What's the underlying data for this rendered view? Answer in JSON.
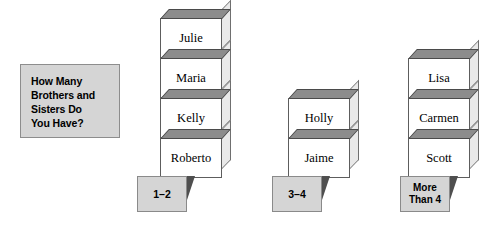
{
  "question": {
    "text": "How Many\nBrothers and\nSisters Do\nYou Have?"
  },
  "colors": {
    "box_fill": "#d5d5d5",
    "box_border": "#8d8d8d",
    "cube_front": "#ffffff",
    "cube_top": "#8c8c8c",
    "cube_side": "#e9e9e9",
    "cube_outline": "#5d5d5d",
    "tent_fill": "#d5d5d5",
    "tent_flap": "#4f4f4f",
    "background": "#ffffff"
  },
  "chart_data": {
    "type": "bar",
    "title": "How Many Brothers and Sisters Do You Have?",
    "xlabel": "",
    "ylabel": "",
    "categories": [
      "1–2",
      "3–4",
      "More\nThan 4"
    ],
    "values": [
      4,
      2,
      3
    ],
    "ylim": [
      0,
      4
    ],
    "grid": false,
    "legend": false,
    "annotations": [
      "pictograph: each stacked cube is one student name"
    ],
    "series": [
      {
        "name": "students",
        "values": [
          4,
          2,
          3
        ]
      }
    ]
  },
  "stacks": [
    {
      "label": "1–2",
      "label_lines": 1,
      "left": 160,
      "bottom": 178,
      "tent_left": 137,
      "tent_top": 176,
      "count": 4,
      "names": [
        "Julie",
        "Maria",
        "Kelly",
        "Roberto"
      ]
    },
    {
      "label": "3–4",
      "label_lines": 1,
      "left": 288,
      "bottom": 178,
      "tent_left": 272,
      "tent_top": 176,
      "count": 2,
      "names": [
        "Holly",
        "Jaime"
      ]
    },
    {
      "label": "More\nThan 4",
      "label_lines": 2,
      "left": 408,
      "bottom": 178,
      "tent_left": 400,
      "tent_top": 176,
      "count": 3,
      "names": [
        "Lisa",
        "Carmen",
        "Scott"
      ]
    }
  ]
}
